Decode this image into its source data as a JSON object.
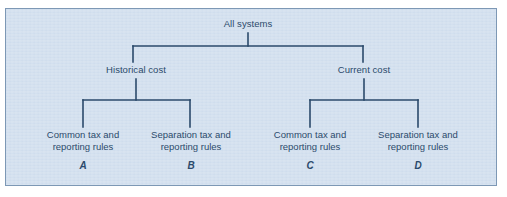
{
  "figure": {
    "type": "hierarchy-tree",
    "background_color": "#d3e0ef",
    "border_color": "#7d98b5",
    "line_color": "#2b4a6b",
    "text_color": "#2b4a6b"
  },
  "tree": {
    "root": {
      "label": "All systems"
    },
    "branches": [
      {
        "id": "historical",
        "label": "Historical cost"
      },
      {
        "id": "current",
        "label": "Current cost"
      }
    ],
    "leaves": [
      {
        "id": "a",
        "line1": "Common tax and",
        "line2": "reporting rules",
        "key": "A",
        "parent": "historical"
      },
      {
        "id": "b",
        "line1": "Separation tax and",
        "line2": "reporting rules",
        "key": "B",
        "parent": "historical"
      },
      {
        "id": "c",
        "line1": "Common tax and",
        "line2": "reporting rules",
        "key": "C",
        "parent": "current"
      },
      {
        "id": "d",
        "line1": "Separation tax and",
        "line2": "reporting rules",
        "key": "D",
        "parent": "current"
      }
    ]
  }
}
